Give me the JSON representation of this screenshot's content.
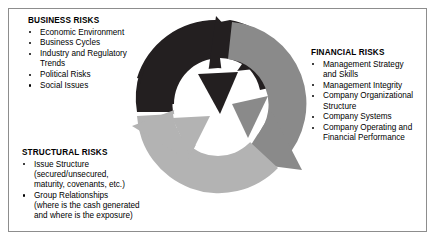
{
  "figure": {
    "background_color": "#ffffff",
    "border_color": "#8d8d8d"
  },
  "graphic": {
    "name": "three-arrow-cycle",
    "description": "Circular cycle of three curved arrows rotating clockwise",
    "arrows": [
      {
        "id": "business",
        "color": "#231f20",
        "label": "top-left-dark-arrow"
      },
      {
        "id": "financial",
        "color": "#8a8a8a",
        "label": "right-medium-gray-arrow"
      },
      {
        "id": "structural",
        "color": "#b3b3b3",
        "label": "bottom-left-light-gray-arrow"
      }
    ],
    "center_color": "#ffffff"
  },
  "blocks": {
    "business": {
      "title": "BUSINESS RISKS",
      "items": [
        "Economic Environment",
        "Business Cycles",
        "Industry and Regulatory\nTrends",
        "Political Risks",
        "Social Issues"
      ]
    },
    "financial": {
      "title": "FINANCIAL RISKS",
      "items": [
        "Management Strategy\nand Skills",
        "Management Integrity",
        "Company Organizational\nStructure",
        "Company Systems",
        "Company Operating and\nFinancial Performance"
      ]
    },
    "structural": {
      "title": "STRUCTURAL RISKS",
      "items": [
        "Issue Structure\n(secured/unsecured,\nmaturity, covenants, etc.)",
        "Group Relationships\n(where is the cash generated\nand where is the exposure)"
      ]
    }
  }
}
